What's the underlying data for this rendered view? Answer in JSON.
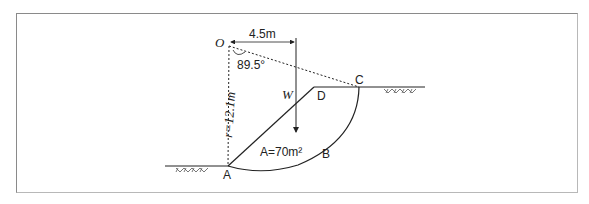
{
  "diagram": {
    "type": "slope-stability-circular-failure",
    "labels": {
      "center": "O",
      "moment_arm": "4.5m",
      "angle": "89.5°",
      "radius": "r=12.1m",
      "weight": "W",
      "area": "A=70m²",
      "point_a": "A",
      "point_b": "B",
      "point_c": "C",
      "point_d": "D"
    },
    "colors": {
      "line": "#222222",
      "frame": "#8a8a8a",
      "hatch": "#555555"
    }
  }
}
